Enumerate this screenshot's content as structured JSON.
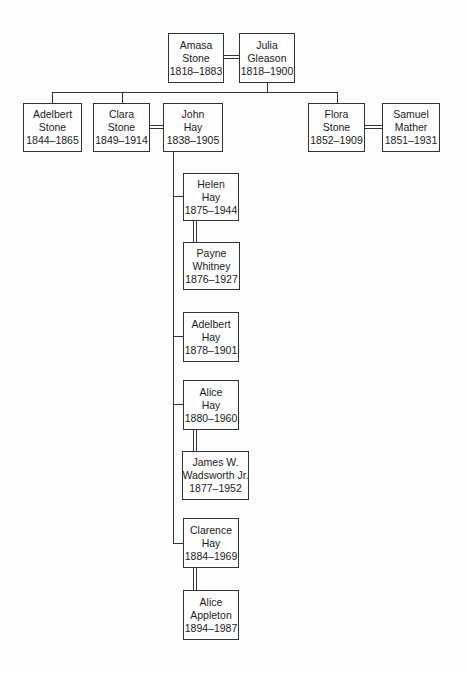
{
  "diagram": {
    "type": "family-tree",
    "colors": {
      "line": "#333333",
      "text": "#1c1c1c",
      "background": "#fdfdfd"
    }
  },
  "people": {
    "amasa_stone": {
      "given": "Amasa",
      "surname": "Stone",
      "dates": "1818–1883"
    },
    "julia_gleason": {
      "given": "Julia",
      "surname": "Gleason",
      "dates": "1818–1900"
    },
    "adelbert_stone": {
      "given": "Adelbert",
      "surname": "Stone",
      "dates": "1844–1865"
    },
    "clara_stone": {
      "given": "Clara",
      "surname": "Stone",
      "dates": "1849–1914"
    },
    "john_hay": {
      "given": "John",
      "surname": "Hay",
      "dates": "1838–1905"
    },
    "flora_stone": {
      "given": "Flora",
      "surname": "Stone",
      "dates": "1852–1909"
    },
    "samuel_mather": {
      "given": "Samuel",
      "surname": "Mather",
      "dates": "1851–1931"
    },
    "helen_hay": {
      "given": "Helen",
      "surname": "Hay",
      "dates": "1875–1944"
    },
    "payne_whitney": {
      "given": "Payne",
      "surname": "Whitney",
      "dates": "1876–1927"
    },
    "adelbert_hay": {
      "given": "Adelbert",
      "surname": "Hay",
      "dates": "1878–1901"
    },
    "alice_hay": {
      "given": "Alice",
      "surname": "Hay",
      "dates": "1880–1960"
    },
    "james_wadsworth": {
      "given": "James W.",
      "surname": "Wadsworth Jr.",
      "dates": "1877–1952"
    },
    "clarence_hay": {
      "given": "Clarence",
      "surname": "Hay",
      "dates": "1884–1969"
    },
    "alice_appleton": {
      "given": "Alice",
      "surname": "Appleton",
      "dates": "1894–1987"
    }
  }
}
